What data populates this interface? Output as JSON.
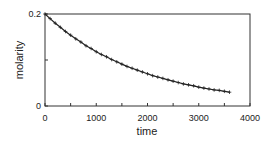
{
  "chart_data": {
    "type": "line",
    "title": "",
    "xlabel": "time",
    "ylabel": "molarity",
    "xlim": [
      0,
      4000
    ],
    "ylim": [
      0,
      0.2
    ],
    "x_ticks": [
      "0",
      "1000",
      "2000",
      "3000",
      "4000"
    ],
    "y_ticks": [
      "0",
      "0.2"
    ],
    "grid": false,
    "legend": null,
    "marker": "+",
    "series": [
      {
        "name": "molarity",
        "model": "0.2*exp(-0.000525*t)",
        "x": [
          0,
          100,
          200,
          300,
          400,
          500,
          600,
          700,
          800,
          900,
          1000,
          1100,
          1200,
          1300,
          1400,
          1500,
          1600,
          1700,
          1800,
          1900,
          2000,
          2100,
          2200,
          2300,
          2400,
          2500,
          2600,
          2700,
          2800,
          2900,
          3000,
          3100,
          3200,
          3300,
          3400,
          3500,
          3600
        ],
        "values": [
          0.2,
          0.19,
          0.18,
          0.171,
          0.162,
          0.154,
          0.146,
          0.139,
          0.131,
          0.125,
          0.118,
          0.112,
          0.107,
          0.101,
          0.096,
          0.091,
          0.086,
          0.082,
          0.078,
          0.074,
          0.07,
          0.066,
          0.063,
          0.06,
          0.057,
          0.054,
          0.051,
          0.048,
          0.046,
          0.044,
          0.041,
          0.039,
          0.037,
          0.035,
          0.034,
          0.032,
          0.03
        ]
      }
    ]
  },
  "colors": {
    "line": "#222222",
    "axis": "#333333",
    "background": "#ffffff"
  }
}
